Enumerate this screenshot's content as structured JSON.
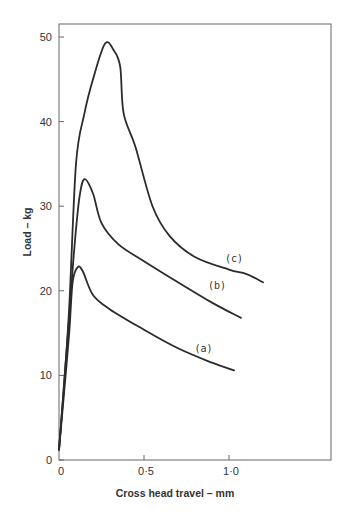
{
  "chart_data": {
    "type": "line",
    "title": "",
    "xlabel": "Cross  head travel – mm",
    "ylabel": "Load  –  kg",
    "xlim": [
      0,
      1.6
    ],
    "ylim": [
      0,
      52
    ],
    "grid": false,
    "legend": "inline labels at curve ends",
    "x_ticks": [
      0,
      0.5,
      1.0
    ],
    "x_tick_labels": [
      "0",
      "0·5",
      "1·0"
    ],
    "y_ticks": [
      0,
      10,
      20,
      30,
      40,
      50
    ],
    "y_tick_labels": [
      "0",
      "10",
      "20",
      "30",
      "40",
      "50"
    ],
    "series": [
      {
        "name": "(a)",
        "x": [
          0,
          0.03,
          0.06,
          0.08,
          0.11,
          0.14,
          0.2,
          0.3,
          0.5,
          0.7,
          0.9,
          1.03
        ],
        "values": [
          1.2,
          8,
          15,
          21,
          22.8,
          22.3,
          19.5,
          17.8,
          15.4,
          13.2,
          11.5,
          10.6
        ]
      },
      {
        "name": "(b)",
        "x": [
          0,
          0.03,
          0.06,
          0.09,
          0.12,
          0.15,
          0.2,
          0.25,
          0.35,
          0.5,
          0.7,
          0.9,
          1.07
        ],
        "values": [
          1.2,
          9,
          17,
          25,
          31,
          33.2,
          31.5,
          28,
          25.5,
          23.5,
          21.0,
          18.6,
          16.8
        ]
      },
      {
        "name": "(c)",
        "x": [
          0,
          0.03,
          0.06,
          0.1,
          0.15,
          0.2,
          0.27,
          0.32,
          0.36,
          0.38,
          0.45,
          0.55,
          0.65,
          0.8,
          1.0,
          1.1,
          1.2
        ],
        "values": [
          1.2,
          9,
          18,
          35,
          41,
          45,
          49.2,
          48.5,
          46.5,
          41,
          37,
          30,
          26.5,
          24,
          22.5,
          22,
          21
        ]
      }
    ],
    "annotations": [
      {
        "text": "(a)",
        "x": 0.85,
        "y": 12.8
      },
      {
        "text": "(b)",
        "x": 0.93,
        "y": 20.2
      },
      {
        "text": "(c)",
        "x": 1.03,
        "y": 23.4
      }
    ]
  }
}
